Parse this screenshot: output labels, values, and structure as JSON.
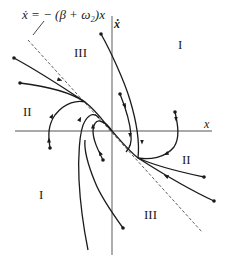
{
  "diagram": {
    "equation_label": "ẋ = − (β + ω₂)x",
    "axes": {
      "x_label": "x",
      "y_label": "ẋ"
    },
    "regions": [
      {
        "id": "region-I-top",
        "label": "I"
      },
      {
        "id": "region-III-top",
        "label": "III"
      },
      {
        "id": "region-II-left",
        "label": "II"
      },
      {
        "id": "region-II-right",
        "label": "II"
      },
      {
        "id": "region-I-bottom",
        "label": "I"
      },
      {
        "id": "region-III-bottom",
        "label": "III"
      }
    ],
    "colors": {
      "line": "#1a1a1a",
      "axis": "#555555",
      "dashed": "#333333",
      "background": "#ffffff"
    }
  }
}
